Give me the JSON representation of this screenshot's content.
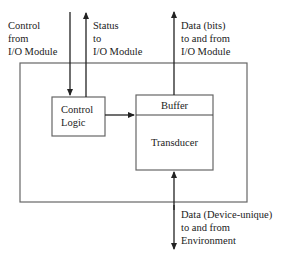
{
  "diagram": {
    "type": "block-diagram",
    "title": "",
    "labels": {
      "control_in": "Control\nfrom\nI/O Module",
      "status_out": "Status\nto\nI/O Module",
      "data_bits": "Data (bits)\nto and from\nI/O Module",
      "data_env": "Data (Device-unique)\nto and from\nEnvironment"
    },
    "boxes": {
      "outer": "",
      "control_logic": "Control\nLogic",
      "buffer": "Buffer",
      "transducer": "Transducer"
    },
    "colors": {
      "line": "#333333",
      "box_border": "#666666",
      "background": "#ffffff"
    }
  }
}
